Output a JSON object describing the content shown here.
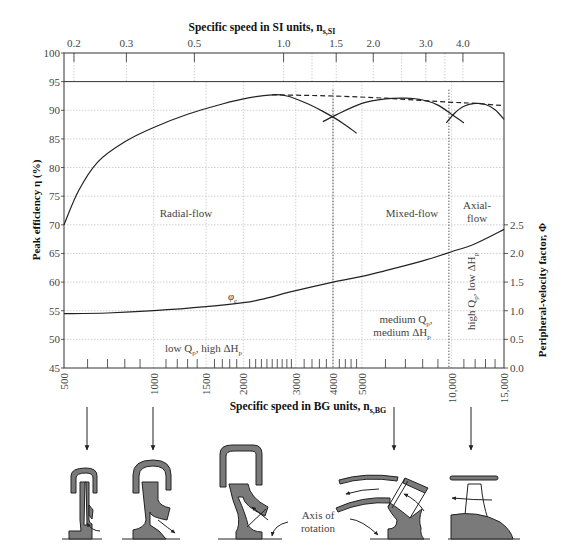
{
  "chart_data": {
    "type": "line",
    "title_top_axis": "Specific speed in SI units, n",
    "title_top_axis_sub": "s,SI",
    "xlabel": "Specific speed in BG units, n",
    "xlabel_sub": "s,BG",
    "ylabel_left": "Peak efficiency η (%)",
    "ylabel_right": "Peripheral-velocity factor, Φ",
    "x_scale": "log",
    "xlim_bg": [
      500,
      15000
    ],
    "ylim_left": [
      45,
      100
    ],
    "ylim_right": [
      0.0,
      2.5
    ],
    "grid": true,
    "bg_tick_labels": [
      "500",
      "1000",
      "1500",
      "2000",
      "3000",
      "4000",
      "5000",
      "10,000",
      "15,000"
    ],
    "bg_tick_values": [
      500,
      1000,
      1500,
      2000,
      3000,
      4000,
      5000,
      10000,
      15000
    ],
    "si_tick_labels": [
      "0.2",
      "0.3",
      "0.5",
      "1.0",
      "1.5",
      "2.0",
      "3.0",
      "4.0"
    ],
    "si_tick_values_bg": [
      540,
      810,
      1370,
      2730,
      4100,
      5460,
      8200,
      10920
    ],
    "left_tick_labels": [
      "100",
      "95",
      "90",
      "85",
      "80",
      "75",
      "70",
      "65",
      "60",
      "55",
      "50",
      "45"
    ],
    "right_tick_labels": [
      "2.5",
      "2.0",
      "1.5",
      "1.0",
      "0.5",
      "0.0"
    ],
    "series": [
      {
        "name": "Radial-flow peak efficiency",
        "axis": "left",
        "x": [
          500,
          560,
          650,
          800,
          1000,
          1300,
          1700,
          2100,
          2500,
          2800,
          3200,
          3700,
          4300,
          4800
        ],
        "y": [
          70,
          76,
          81,
          84.5,
          87,
          89.3,
          91.1,
          92.2,
          92.7,
          92.5,
          91.4,
          89.8,
          87.8,
          86
        ]
      },
      {
        "name": "Mixed-flow peak efficiency",
        "axis": "left",
        "x": [
          3700,
          4100,
          5000,
          6000,
          7000,
          8000,
          9000,
          10000,
          11000
        ],
        "y": [
          88,
          89.2,
          91.2,
          92.0,
          92.1,
          91.8,
          90.9,
          89.3,
          87.8
        ]
      },
      {
        "name": "Axial-flow peak efficiency",
        "axis": "left",
        "x": [
          9600,
          10200,
          11000,
          12000,
          13000,
          14000,
          15000
        ],
        "y": [
          87.8,
          89.4,
          90.7,
          91.2,
          91.0,
          90.1,
          88.4
        ]
      },
      {
        "name": "Envelope (dashed)",
        "axis": "left",
        "style": "dashed",
        "x": [
          2500,
          4000,
          6000,
          8000,
          10000,
          12000,
          15000
        ],
        "y": [
          92.7,
          92.5,
          92.1,
          91.7,
          91.4,
          91.2,
          90.8
        ]
      },
      {
        "name": "φ_e peripheral-velocity factor",
        "axis": "right",
        "x": [
          500,
          700,
          1000,
          1500,
          2000,
          2300,
          3000,
          4000,
          5000,
          6000,
          8000,
          10000,
          12000,
          15000
        ],
        "y": [
          0.95,
          0.96,
          1.0,
          1.07,
          1.14,
          1.2,
          1.35,
          1.5,
          1.6,
          1.7,
          1.87,
          2.03,
          2.17,
          2.42
        ]
      }
    ],
    "vertical_dividers_bg": [
      4000,
      9800
    ],
    "annotations": {
      "radial": "Radial-flow",
      "mixed": "Mixed-flow",
      "axial_line1": "Axial-",
      "axial_line2": "flow",
      "phi": "φ",
      "phi_sub": "e",
      "low_q": "low Q",
      "low_q_rest": ", high ΔH",
      "medium_line1": "medium Q",
      "medium_line2": "medium ΔH",
      "high_q": "high Q",
      "high_q_rest": ", low ΔH",
      "sub_p": "p",
      "axis_of": "Axis of",
      "rotation": "rotation"
    }
  },
  "colors": {
    "curve": "#222222",
    "grid": "#bbbbbb",
    "impeller_fill": "#7a7a7a",
    "text": "#444444"
  }
}
